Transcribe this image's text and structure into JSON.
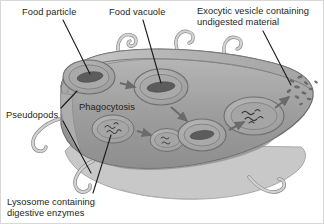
{
  "figure": {
    "background_color": "#ffffff",
    "border_color": "#d8d8d8",
    "text_color": "#231f20"
  },
  "labels": {
    "food_particle": "Food particle",
    "food_vacuole": "Food vacuole",
    "exocytic_vesicle": "Exocytic vesicle containing\nundigested material",
    "pseudopods": "Pseudopods",
    "phagocytosis": "Phagocytosis",
    "lysosome": "Lysosome containing\ndigestive enzymes"
  },
  "palette": {
    "cytoplasm_fill": "#9e9e9e",
    "cytoplasm_top_fill": "#b4b4b4",
    "membrane_stroke": "#6e6e6e",
    "membrane_light": "#cfcfcf",
    "vacuole_fill": "#a8a8a8",
    "vacuole_stroke": "#707070",
    "food_particle_fill": "#5c5c5c",
    "enzyme_stroke": "#3d3d3d",
    "arrow_fill": "#6b6b6b",
    "leader_line": "#1a1a1a",
    "debris_fill": "#6a6a6a",
    "underside_fill": "#c6c6c6"
  },
  "structures": [
    {
      "name": "forming-food-vacuole",
      "stage": 1,
      "contains": "food particle",
      "cx": 88,
      "cy": 76
    },
    {
      "name": "food-vacuole",
      "stage": 2,
      "contains": "food particle",
      "cx": 160,
      "cy": 86
    },
    {
      "name": "lysosome",
      "stage": 3,
      "contains": "digestive enzymes",
      "cx": 112,
      "cy": 128
    },
    {
      "name": "lysosome-fusing-with-vacuole",
      "stage": 4,
      "contains": "enzymes and food",
      "cx": 185,
      "cy": 135
    },
    {
      "name": "digestive-vacuole",
      "stage": 5,
      "contains": "undigested material",
      "cx": 253,
      "cy": 115
    },
    {
      "name": "exocytic-release",
      "stage": 6,
      "contains": "expelled debris",
      "cx": 300,
      "cy": 88
    }
  ],
  "arrows": [
    {
      "name": "arrow-vacuole-formation",
      "from": "forming-food-vacuole",
      "to": "food-vacuole"
    },
    {
      "name": "arrow-vacuole-descent",
      "from": "food-vacuole",
      "to": "lysosome-fusing-with-vacuole"
    },
    {
      "name": "arrow-lysosome-fusion",
      "from": "lysosome",
      "to": "lysosome-fusing-with-vacuole"
    },
    {
      "name": "arrow-digestion",
      "from": "lysosome-fusing-with-vacuole",
      "to": "digestive-vacuole"
    },
    {
      "name": "arrow-exocytosis",
      "from": "digestive-vacuole",
      "to": "exocytic-release"
    }
  ],
  "pseudopod_count": 6
}
